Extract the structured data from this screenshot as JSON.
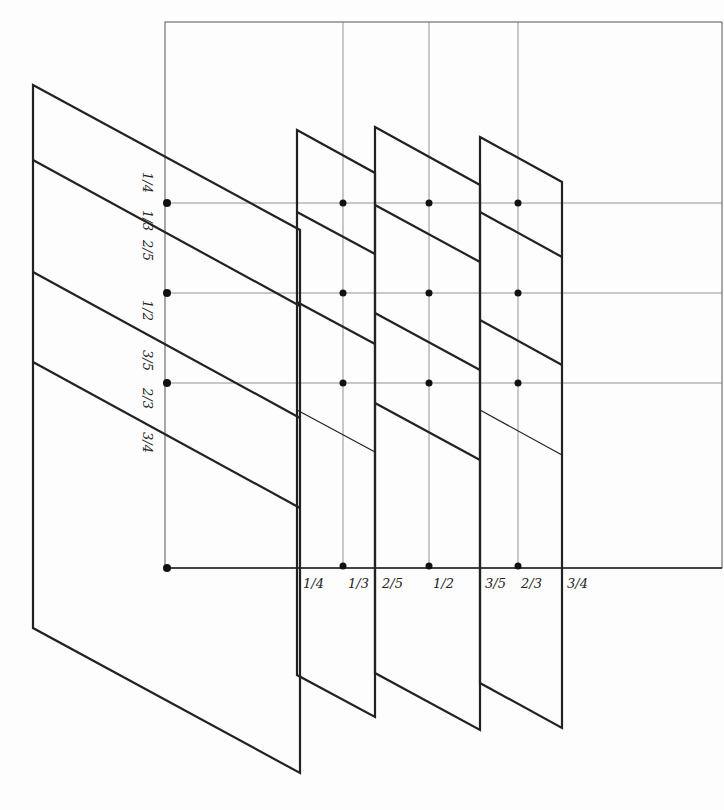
{
  "diagram": {
    "left_labels": [
      "1/4",
      "1/3",
      "2/5",
      "1/2",
      "3/5",
      "2/3",
      "3/4"
    ],
    "bottom_labels": [
      "1/4",
      "1/3",
      "2/5",
      "1/2",
      "3/5",
      "2/3",
      "3/4"
    ],
    "colors": {
      "line": "#222222",
      "thin": "#555555",
      "bg": "#fdfdfd"
    }
  }
}
